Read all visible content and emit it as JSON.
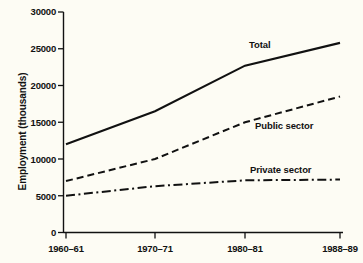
{
  "chart_data": {
    "type": "line",
    "title": "",
    "xlabel": "",
    "ylabel": "Employment (thousands)",
    "x": [
      "1960–61",
      "1970–71",
      "1980–81",
      "1988–89"
    ],
    "xtick_labels": [
      "1960–61",
      "1970–71",
      "1980–81",
      "1988–89"
    ],
    "ytick_labels": [
      "0",
      "5000",
      "10000",
      "15000",
      "20000",
      "25000",
      "30000"
    ],
    "ytick_values": [
      0,
      5000,
      10000,
      15000,
      20000,
      25000,
      30000
    ],
    "ylim": [
      0,
      30000
    ],
    "grid": false,
    "legend_position": "inline-annotations",
    "series": [
      {
        "name": "Total",
        "label": "Total",
        "linestyle": "solid",
        "color": "#111111",
        "values": [
          12000,
          16500,
          22700,
          25800
        ]
      },
      {
        "name": "Public sector",
        "label": "Public sector",
        "linestyle": "dashed",
        "color": "#111111",
        "values": [
          7000,
          10000,
          15000,
          18500
        ]
      },
      {
        "name": "Private sector",
        "label": "Private sector",
        "linestyle": "dashdot",
        "color": "#111111",
        "values": [
          5000,
          6300,
          7100,
          7200
        ]
      }
    ]
  },
  "axes": {
    "y_axis_title": "Employment (thousands)",
    "y_ticks": [
      {
        "label": "30000",
        "value": 30000
      },
      {
        "label": "25000",
        "value": 25000
      },
      {
        "label": "20000",
        "value": 20000
      },
      {
        "label": "15000",
        "value": 15000
      },
      {
        "label": "10000",
        "value": 10000
      },
      {
        "label": "5000",
        "value": 5000
      },
      {
        "label": "0",
        "value": 0
      }
    ],
    "x_ticks": [
      {
        "label": "1960–61"
      },
      {
        "label": "1970–71"
      },
      {
        "label": "1980–81"
      },
      {
        "label": "1988–89"
      }
    ]
  },
  "annotations": {
    "total": "Total",
    "public_sector": "Public sector",
    "private_sector": "Private sector"
  },
  "colors": {
    "background": "#fdfcf4",
    "ink": "#111111"
  }
}
